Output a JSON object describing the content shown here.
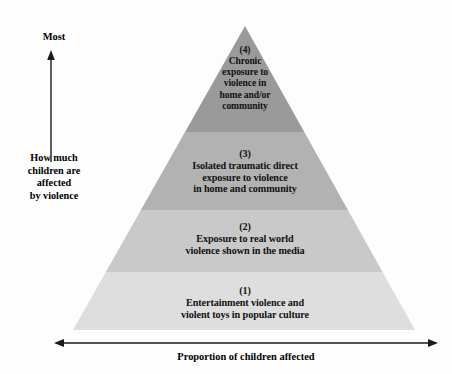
{
  "figure": {
    "type": "pyramid-diagram",
    "background_color": "#fdfdfd"
  },
  "axes": {
    "vertical": {
      "top_label": "Most",
      "axis_label_lines": [
        "How much",
        "children are",
        "affected",
        "by violence"
      ],
      "arrow_direction": "up",
      "color": "#1a1a1a"
    },
    "horizontal": {
      "label": "Proportion of children affected",
      "arrow_direction": "both",
      "color": "#1a1a1a"
    }
  },
  "pyramid": {
    "apex": {
      "x": 245,
      "y": 26
    },
    "base_left": {
      "x": 73,
      "y": 330
    },
    "base_right": {
      "x": 415,
      "y": 330
    },
    "tiers": [
      {
        "number": "(4)",
        "text": "Chronic exposure to violence in home and/or community",
        "lines": [
          "Chronic",
          "exposure to",
          "violence in",
          "home and/or",
          "community"
        ],
        "fill": "#9a9a9a",
        "y_top": 26,
        "y_bottom": 132
      },
      {
        "number": "(3)",
        "text": "Isolated traumatic direct exposure to violence in home and community",
        "lines": [
          "Isolated traumatic direct",
          "exposure to violence",
          "in home and community"
        ],
        "fill": "#b2b2b2",
        "y_top": 132,
        "y_bottom": 210
      },
      {
        "number": "(2)",
        "text": "Exposure to real world violence shown in the media",
        "lines": [
          "Exposure to real world",
          "violence shown in the media"
        ],
        "fill": "#c9c9c9",
        "y_top": 210,
        "y_bottom": 272
      },
      {
        "number": "(1)",
        "text": "Entertainment violence and violent toys in popular culture",
        "lines": [
          "Entertainment violence and",
          "violent toys in popular culture"
        ],
        "fill": "#dedede",
        "y_top": 272,
        "y_bottom": 330
      }
    ]
  },
  "caption": {
    "partial_text": ""
  }
}
